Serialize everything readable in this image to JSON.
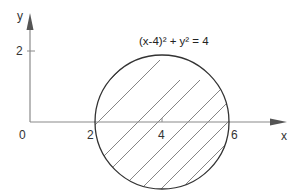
{
  "figure": {
    "equation": "(x-4)² + y² = 4",
    "axes": {
      "x_label": "x",
      "y_label": "y",
      "origin_label": "0",
      "x_ticks": [
        "2",
        "4",
        "6"
      ],
      "y_ticks": [
        "2"
      ]
    },
    "circle": {
      "center": [
        4,
        0
      ],
      "radius": 2,
      "fill": "hatched"
    },
    "colors": {
      "axis": "#8a8a8a",
      "circle": "#333333",
      "hatch": "#777777",
      "text": "#333333"
    }
  }
}
